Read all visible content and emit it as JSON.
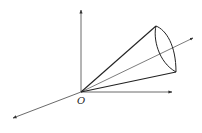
{
  "diagram": {
    "type": "3d-coordinate-cone",
    "origin_label": "O",
    "colors": {
      "stroke": "#222222",
      "axis": "#444444",
      "background": "#ffffff"
    },
    "origin": {
      "x": 81,
      "y": 92
    },
    "axes": {
      "vertical_end": {
        "x": 81,
        "y": 10
      },
      "horizontal_end": {
        "x": 172,
        "y": 92
      },
      "depth_neg_end": {
        "x": 13,
        "y": 118
      },
      "depth_pos_end": {
        "x": 193,
        "y": 38
      }
    },
    "cone": {
      "apex": {
        "x": 81,
        "y": 92
      },
      "rim_top": {
        "x": 156,
        "y": 26
      },
      "rim_bottom": {
        "x": 176,
        "y": 72
      }
    }
  }
}
